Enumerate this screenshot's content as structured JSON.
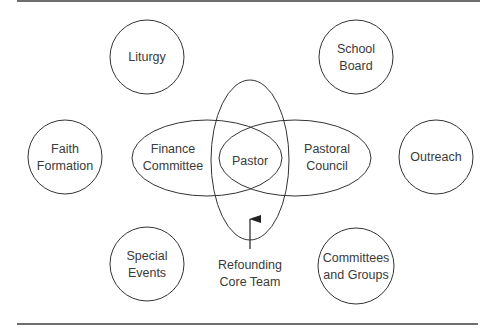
{
  "diagram": {
    "type": "organizational-overlap-diagram",
    "stroke_color": "#333333",
    "text_color": "#3a3a3a",
    "rule_color": "#6f6f6f",
    "central": {
      "finance": {
        "label_lines": [
          "Finance",
          "Committee"
        ]
      },
      "pastoral": {
        "label_lines": [
          "Pastoral",
          "Council"
        ]
      },
      "pastor": {
        "label": "Pastor"
      },
      "refounding": {
        "label_lines": [
          "Refounding",
          "Core Team"
        ]
      }
    },
    "satellites": [
      {
        "id": "liturgy",
        "label_lines": [
          "Liturgy"
        ]
      },
      {
        "id": "school-board",
        "label_lines": [
          "School",
          "Board"
        ]
      },
      {
        "id": "faith-formation",
        "label_lines": [
          "Faith",
          "Formation"
        ]
      },
      {
        "id": "outreach",
        "label_lines": [
          "Outreach"
        ]
      },
      {
        "id": "special-events",
        "label_lines": [
          "Special",
          "Events"
        ]
      },
      {
        "id": "committees-groups",
        "label_lines": [
          "Committees",
          "and Groups"
        ]
      }
    ]
  }
}
